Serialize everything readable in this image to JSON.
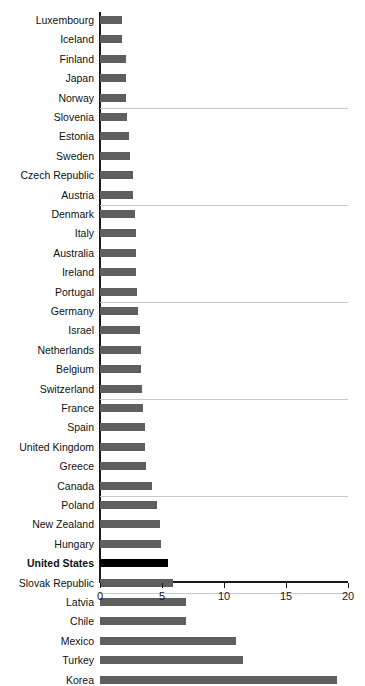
{
  "chart_data": {
    "type": "bar",
    "orientation": "horizontal",
    "title": "",
    "subtitle": "",
    "xlabel": "",
    "ylabel": "",
    "xlim": [
      0,
      20
    ],
    "xticks": [
      0,
      5,
      10,
      15,
      20
    ],
    "xtick_labels": [
      "0",
      "5",
      "10",
      "15",
      "20"
    ],
    "grid": "horizontal-group-separators",
    "legend": "none",
    "highlight_category": "United States",
    "colors": {
      "bar": "#5f5f5f",
      "highlight_bar": "#000000",
      "axis": "#1a1a1a",
      "gridline": "#c9c9c9",
      "background": "#ffffff",
      "label": "#111111"
    },
    "categories": [
      "Luxembourg",
      "Iceland",
      "Finland",
      "Japan",
      "Norway",
      "Slovenia",
      "Estonia",
      "Sweden",
      "Czech Republic",
      "Austria",
      "Denmark",
      "Italy",
      "Australia",
      "Ireland",
      "Portugal",
      "Germany",
      "Israel",
      "Netherlands",
      "Belgium",
      "Switzerland",
      "France",
      "Spain",
      "United Kingdom",
      "Greece",
      "Canada",
      "Poland",
      "New Zealand",
      "Hungary",
      "United States",
      "Slovak Republic",
      "Latvia",
      "Chile",
      "Mexico",
      "Turkey",
      "Korea"
    ],
    "values": [
      1.8,
      1.8,
      2.1,
      2.1,
      2.1,
      2.2,
      2.3,
      2.4,
      2.7,
      2.7,
      2.8,
      2.9,
      2.9,
      2.9,
      3.0,
      3.1,
      3.2,
      3.3,
      3.3,
      3.4,
      3.5,
      3.6,
      3.6,
      3.7,
      4.2,
      4.6,
      4.8,
      4.9,
      5.5,
      5.9,
      6.9,
      6.9,
      11.0,
      11.5,
      19.1
    ]
  }
}
